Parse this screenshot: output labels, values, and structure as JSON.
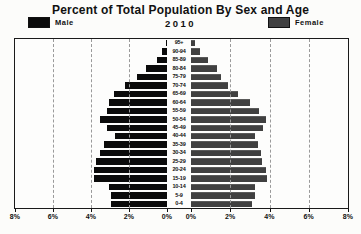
{
  "title": "Percent of Total Population By Sex and Age",
  "subtitle_year": "2010",
  "legend": {
    "male": "Male",
    "female": "Female"
  },
  "colors": {
    "male_bar": "#0b0b0b",
    "female_bar": "#404040",
    "gridline": "#9a9a9a",
    "plot_border": "#1a1a1a",
    "background": "#fcfcfa"
  },
  "axis": {
    "left_tick_labels": [
      "8%",
      "6%",
      "4%",
      "2%",
      "0%"
    ],
    "right_tick_labels": [
      "0%",
      "2%",
      "4%",
      "6%",
      "8%"
    ],
    "max_percent": 8,
    "gridline_percents": [
      2,
      4,
      6
    ]
  },
  "chart_data": {
    "type": "bar",
    "subtype": "population-pyramid",
    "title": "Percent of Total Population By Sex and Age",
    "subtitle": "2010",
    "xlabel": "Percent of total population",
    "xlim": [
      0,
      8
    ],
    "grid": "dashed-vertical",
    "legend_position": "top",
    "categories_top_to_bottom": [
      "95+",
      "90-94",
      "85-89",
      "80-84",
      "75-79",
      "70-74",
      "65-69",
      "60-64",
      "55-59",
      "50-54",
      "45-49",
      "40-44",
      "35-39",
      "30-34",
      "25-29",
      "20-24",
      "15-19",
      "10-14",
      "5-9",
      "0-4"
    ],
    "series": [
      {
        "name": "Male",
        "side": "left",
        "values": [
          0.05,
          0.25,
          0.55,
          1.1,
          1.6,
          2.2,
          2.8,
          3.05,
          3.15,
          3.55,
          3.15,
          2.75,
          3.3,
          3.55,
          3.75,
          3.85,
          3.85,
          3.05,
          2.95,
          2.95
        ]
      },
      {
        "name": "Female",
        "side": "right",
        "values": [
          0.2,
          0.45,
          0.85,
          1.3,
          1.55,
          1.9,
          2.4,
          3.0,
          3.45,
          3.8,
          3.65,
          3.25,
          3.4,
          3.55,
          3.6,
          3.8,
          3.85,
          3.25,
          3.25,
          3.1
        ]
      }
    ]
  }
}
